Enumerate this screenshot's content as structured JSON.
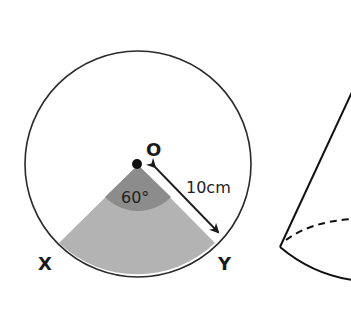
{
  "diagram": {
    "circle": {
      "center_label": "O",
      "radius_label": "10cm",
      "angle_label": "60°",
      "point_left_label": "X",
      "point_right_label": "Y"
    },
    "colors": {
      "stroke": "#2a2a2a",
      "sector_fill": "#b3b3b3",
      "angle_fill": "#8c8c8c",
      "background": "#ffffff"
    },
    "cone": {
      "description": "partial cone with dashed hidden base edge"
    }
  }
}
